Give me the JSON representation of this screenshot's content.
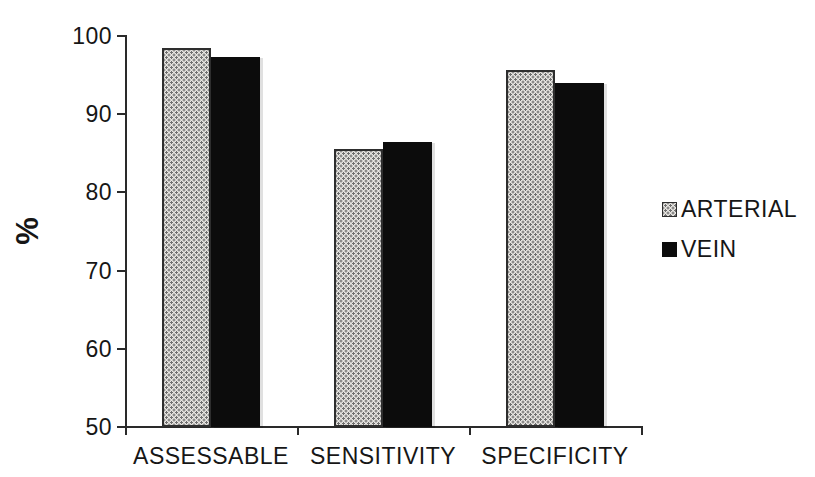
{
  "colors": {
    "background": "#ffffff",
    "text": "#161616",
    "axis": "#2a2a2a",
    "arterial_fill": "#e7e5e1",
    "arterial_dot": "#6e6e6e",
    "vein_fill": "#0c0c0c"
  },
  "chart_data": {
    "type": "bar",
    "title": "",
    "xlabel": "",
    "ylabel": "%",
    "categories": [
      "ASSESSABLE",
      "SENSITIVITY",
      "SPECIFICITY"
    ],
    "series": [
      {
        "name": "ARTERIAL",
        "pattern": "dotted",
        "values": [
          98.5,
          85.5,
          95.7
        ]
      },
      {
        "name": "VEIN",
        "pattern": "solid",
        "values": [
          97.3,
          86.5,
          94.0
        ]
      }
    ],
    "ylim": [
      50,
      100
    ],
    "yticks": [
      100,
      90,
      80,
      70,
      60,
      50
    ],
    "grid": false,
    "legend_position": "right"
  }
}
